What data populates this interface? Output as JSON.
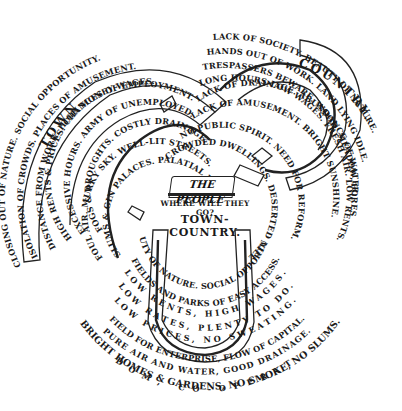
{
  "diagram": {
    "center": {
      "label": "THE PEOPLE",
      "question": "WHERE WILL THEY GO?"
    },
    "town": {
      "title": "TOWN.",
      "lines": [
        "CLOSING OUT OF NATURE. SOCIAL OPPORTUNITY.",
        "ISOLATION OF CROWDS. PLACES OF AMUSEMENT.",
        "DISTANCE FROM WORK. HIGH MONEY WAGES.",
        "HIGH RENTS & PRICES. CHANCES OF EMPLOYMENT.",
        "EXCESSIVE HOURS. ARMY OF UNEMPLOYED.",
        "FOGS & DROUGHTS. COSTLY DRAINAGE.",
        "FOUL AIR. MURKY SKY. WELL-LIT STREETS.",
        "SLUMS & GIN PALACES. PALATIAL EDIFICES."
      ]
    },
    "country": {
      "title": "COUNTRY.",
      "lines": [
        "LACK OF SOCIETY. BEAUTY OF NATURE.",
        "HANDS OUT OF WORK. LAND LYING IDLE.",
        "TRESPASSERS BEWARE. WOOD, MEADOW, FOREST.",
        "LONG HOURS-LOW WAGES. FRESH AIR. LOW RENTS.",
        "LACK OF DRAINAGE. ABUNDANCE OF WATER.",
        "LACK OF AMUSEMENT. BRIGHT SUNSHINE.",
        "NO PUBLIC SPIRIT. NEED FOR REFORM.",
        "CROWDED DWELLINGS. DESERTED VILLAGES."
      ]
    },
    "town_country": {
      "title": "TOWN-COUNTRY.",
      "lines": [
        "BEAUTY OF NATURE. SOCIAL OPPORTUNITY.",
        "FIELDS AND PARKS OF EASY ACCESS.",
        "LOW RENTS, HIGH WAGES.",
        "LOW RATES, PLENTY TO DO.",
        "LOW PRICES, NO SWEATING.",
        "FIELD FOR ENTERPRISE, FLOW OF CAPITAL.",
        "PURE AIR AND WATER, GOOD DRAINAGE.",
        "BRIGHT HOMES & GARDENS, NO SMOKE, NO SLUMS.",
        "FREEDOM, CO-OPERATION."
      ]
    }
  }
}
